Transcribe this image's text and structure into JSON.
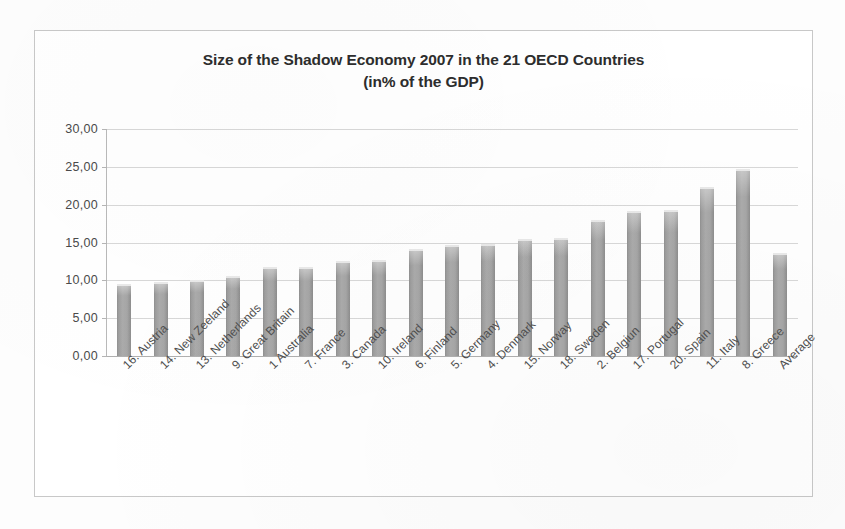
{
  "chart_data": {
    "type": "bar",
    "title": "Size of the Shadow Economy 2007 in the 21 OECD Countries",
    "subtitle": "(in% of the GDP)",
    "xlabel": "",
    "ylabel": "",
    "ylim": [
      0,
      30
    ],
    "yticks": [
      "0,00",
      "5,00",
      "10,00",
      "15,00",
      "20,00",
      "25,00",
      "30,00"
    ],
    "ytick_values": [
      0,
      5,
      10,
      15,
      20,
      25,
      30
    ],
    "grid": true,
    "legend": "none",
    "bar_color": "#a6a6a6",
    "categories": [
      "16. Austria",
      "14. New Zeeland",
      "13. Netherlands",
      "9. Great Britain",
      "1 Australia",
      "7. France",
      "3. Canada",
      "10. Ireland",
      "6. Finland",
      "5. Germany",
      "4. Denmark",
      "15. Norway",
      "18. Sweden",
      "2. Belgiun",
      "17. Portugal",
      "20. Spain",
      "11. Italy",
      "8. Greece",
      "Average"
    ],
    "values": [
      9.5,
      9.8,
      10.1,
      10.6,
      11.7,
      11.8,
      12.6,
      12.7,
      14.2,
      14.7,
      14.8,
      15.4,
      15.6,
      18.0,
      19.2,
      19.3,
      22.3,
      24.7,
      13.6
    ]
  }
}
